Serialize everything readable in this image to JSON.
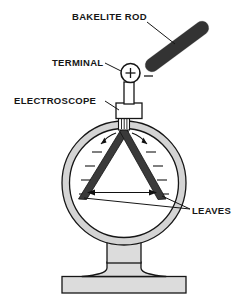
{
  "figure": {
    "title_alt": "Charging an electroscope with a bakelite rod",
    "background_color": "#ffffff",
    "width": 244,
    "height": 305
  },
  "labels": {
    "bakelite_rod": "BAKELITE ROD",
    "terminal": "TERMINAL",
    "electroscope": "ELECTROSCOPE",
    "leaves": "LEAVES"
  },
  "charge_marks": {
    "terminal_charge": "+",
    "rod_charge": "−"
  },
  "colors": {
    "rod_fill": "#3c3c3c",
    "glass_fill": "#d6d6d6",
    "glass_interior": "#ffffff",
    "metal_fill": "#d9d9d9",
    "leaf_fill": "#3a3a3a",
    "line": "#161616",
    "label_text": "#161616"
  },
  "parts": {
    "rod": {
      "name": "bakelite-rod",
      "angle_deg": -36,
      "length": 64,
      "thickness": 13
    },
    "terminal_knob": {
      "name": "terminal-knob",
      "cx": 131,
      "cy": 74,
      "r": 10,
      "symbol": "+"
    },
    "stem": {
      "name": "conducting-stem",
      "x": 126,
      "y": 84,
      "width": 10,
      "height": 22
    },
    "insulator_collar": {
      "name": "insulator-collar",
      "x": 119,
      "y": 104,
      "width": 24,
      "height": 14
    },
    "globe": {
      "name": "glass-globe",
      "cx": 124,
      "cy": 183,
      "outer_r": 62,
      "inner_r": 55
    },
    "leaves": {
      "name": "gold-leaves",
      "apex_x": 124,
      "apex_y": 130,
      "left_tip_x": 79,
      "left_tip_y": 200,
      "right_tip_x": 165,
      "right_tip_y": 200
    },
    "neck": {
      "name": "pedestal-neck",
      "x": 107,
      "y": 243,
      "width": 34,
      "height": 29
    },
    "foot": {
      "name": "pedestal-foot",
      "x": 62,
      "y": 277,
      "width": 124,
      "height": 16
    }
  },
  "annotations": {
    "divergence_arrow": "double-headed arrow between leaf tips indicating divergence",
    "repulsion_arrows": "two curved arrows at leaf apex indicating repulsion",
    "field_ticks": "radiating tick marks around the leaves indicating charge"
  }
}
